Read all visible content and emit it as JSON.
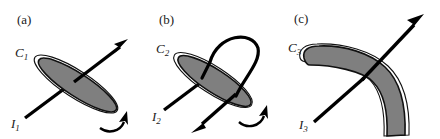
{
  "figure": {
    "background_color": "#ffffff",
    "ink_color": "#000000",
    "lamina_fill_color": "#7f7f7f",
    "panels": [
      {
        "tag": "(a)",
        "body_label": "C",
        "body_label_sub": "1",
        "axis_label": "I",
        "axis_label_sub": "1",
        "body_shape": "thin-ellipse-lamina",
        "axis_arrow": "up-right",
        "spin_arrow": "curved-ccw-bottom-right",
        "description": "Thin elliptical lamina with rotation axis through its centre"
      },
      {
        "tag": "(b)",
        "body_label": "C",
        "body_label_sub": "2",
        "axis_label": "I",
        "axis_label_sub": "2",
        "body_shape": "thin-ellipse-lamina",
        "axis_arrow": "down-left-with-hairpin-loop",
        "spin_arrow": "curved-ccw-bottom-right",
        "description": "Thin elliptical lamina with looped axis re-entering the body"
      },
      {
        "tag": "(c)",
        "body_label": "C",
        "body_label_sub": "3",
        "axis_label": "I",
        "axis_label_sub": "3",
        "body_shape": "boomerang-lamina",
        "axis_arrow": "up-right",
        "spin_arrow": "none",
        "description": "Boomerang shaped lamina with axis through the elbow"
      }
    ]
  }
}
